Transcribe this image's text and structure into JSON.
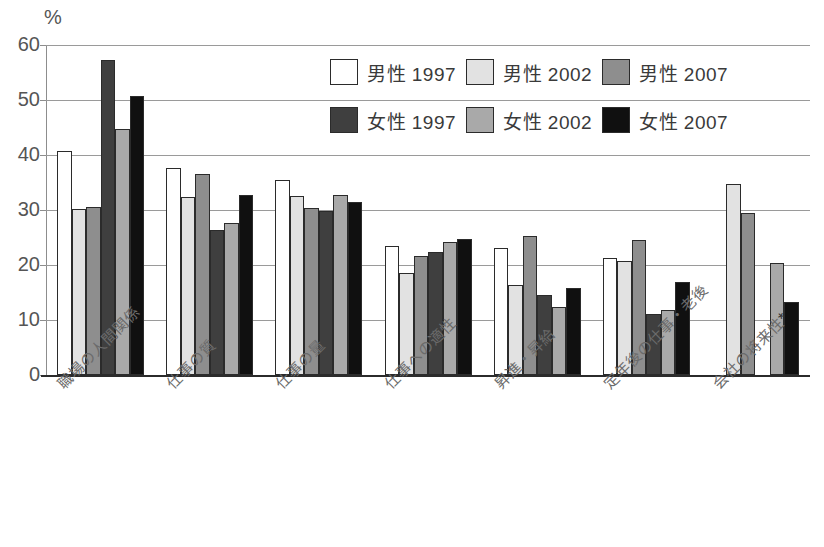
{
  "chart_data": {
    "type": "bar",
    "title": "",
    "subtitle": "",
    "xlabel": "",
    "ylabel": "%",
    "axis_unit": "%",
    "ylim": [
      0,
      60
    ],
    "ytick_labels": [
      "0",
      "10",
      "20",
      "30",
      "40",
      "50",
      "60"
    ],
    "ytick_values": [
      0,
      10,
      20,
      30,
      40,
      50,
      60
    ],
    "grid": true,
    "grid_axis": "y",
    "legend_position": "top-right",
    "categories": [
      "職場の人間関係",
      "仕事の質",
      "仕事の量",
      "仕事への適性",
      "昇進・昇給",
      "定年後の仕事・老後",
      "会社の将来性*"
    ],
    "series": [
      {
        "name": "男性 1997",
        "color": "#ffffff",
        "swatch_class": "sw-m1997",
        "values": [
          40.7,
          37.7,
          35.5,
          23.5,
          23.1,
          21.3,
          null
        ]
      },
      {
        "name": "男性 2002",
        "color": "#e2e2e2",
        "swatch_class": "sw-m2002",
        "values": [
          30.2,
          32.4,
          32.5,
          18.6,
          16.3,
          20.7,
          34.7
        ]
      },
      {
        "name": "男性 2007",
        "color": "#8e8e8e",
        "swatch_class": "sw-m2007",
        "values": [
          30.5,
          36.6,
          30.4,
          21.6,
          25.3,
          24.5,
          29.5
        ]
      },
      {
        "name": "女性 1997",
        "color": "#3f3f3f",
        "swatch_class": "sw-f1997",
        "values": [
          57.3,
          26.4,
          29.8,
          22.4,
          14.5,
          11.1,
          null
        ]
      },
      {
        "name": "女性 2002",
        "color": "#a9a9a9",
        "swatch_class": "sw-f2002",
        "values": [
          44.7,
          27.6,
          32.7,
          24.1,
          12.4,
          11.8,
          20.3
        ]
      },
      {
        "name": "女性 2007",
        "color": "#101010",
        "swatch_class": "sw-f2007",
        "values": [
          50.7,
          32.8,
          31.4,
          24.7,
          15.9,
          17.0,
          13.3
        ]
      }
    ]
  },
  "legend": {
    "items": [
      {
        "label": "男性 1997",
        "swatch_class": "sw-m1997"
      },
      {
        "label": "男性 2002",
        "swatch_class": "sw-m2002"
      },
      {
        "label": "男性 2007",
        "swatch_class": "sw-m2007"
      },
      {
        "label": "女性 1997",
        "swatch_class": "sw-f1997"
      },
      {
        "label": "女性 2002",
        "swatch_class": "sw-f2002"
      },
      {
        "label": "女性 2007",
        "swatch_class": "sw-f2007"
      }
    ]
  },
  "footnote": {
    "text": ""
  }
}
